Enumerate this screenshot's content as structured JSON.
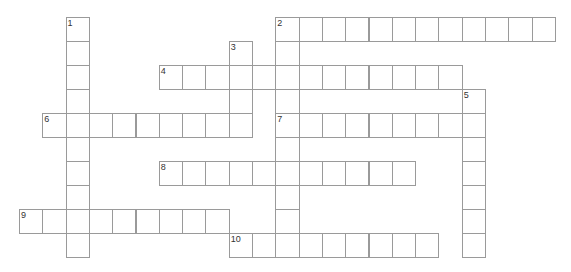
{
  "puzzle": {
    "type": "crossword",
    "grid": {
      "origin_x": 19,
      "origin_y": 17,
      "cell_w": 23.3,
      "cell_h": 24,
      "line_color": "#9a9a9a"
    },
    "entries": [
      {
        "number": "1",
        "direction": "down",
        "row": 0,
        "col": 2,
        "length": 10
      },
      {
        "number": "2",
        "direction": "across",
        "row": 0,
        "col": 11,
        "length": 12
      },
      {
        "number": "2",
        "direction": "down",
        "row": 0,
        "col": 11,
        "length": 9
      },
      {
        "number": "3",
        "direction": "down",
        "row": 1,
        "col": 9,
        "length": 4
      },
      {
        "number": "4",
        "direction": "across",
        "row": 2,
        "col": 6,
        "length": 13
      },
      {
        "number": "5",
        "direction": "down",
        "row": 3,
        "col": 19,
        "length": 7
      },
      {
        "number": "6",
        "direction": "across",
        "row": 4,
        "col": 1,
        "length": 9
      },
      {
        "number": "7",
        "direction": "across",
        "row": 4,
        "col": 11,
        "length": 9
      },
      {
        "number": "8",
        "direction": "across",
        "row": 6,
        "col": 6,
        "length": 11
      },
      {
        "number": "9",
        "direction": "across",
        "row": 8,
        "col": 0,
        "length": 9
      },
      {
        "number": "10",
        "direction": "across",
        "row": 9,
        "col": 9,
        "length": 9
      }
    ]
  }
}
